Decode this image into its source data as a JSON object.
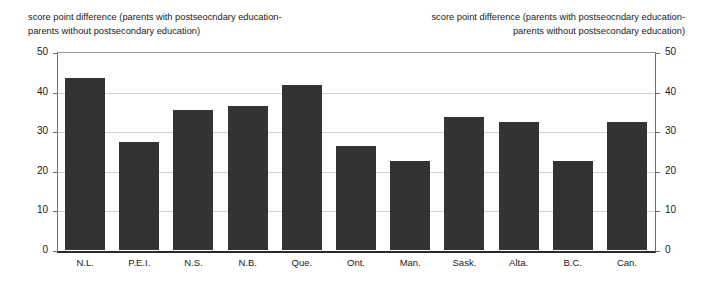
{
  "chart_data": {
    "type": "bar",
    "title": "",
    "subtitle": "",
    "ylabel": "score point difference (parents with postseocndary education-parents without postsecondary education)",
    "ylabel_right": "score point difference (parents with postseocndary education-parents without postsecondary education)",
    "xlabel": "",
    "ylim": [
      0,
      50
    ],
    "yticks": [
      0,
      10,
      20,
      30,
      40,
      50
    ],
    "grid": true,
    "legend": "none",
    "bar_color": "#333333",
    "categories": [
      "N.L.",
      "P.E.I.",
      "N.S.",
      "N.B.",
      "Que.",
      "Ont.",
      "Man.",
      "Sask.",
      "Alta.",
      "B.C.",
      "Can."
    ],
    "values": [
      43.5,
      27.3,
      35.3,
      36.4,
      41.6,
      26.3,
      22.4,
      33.5,
      32.4,
      22.5,
      32.4
    ]
  },
  "axis_titles": {
    "left_line1": "score point difference (parents with postseocndary education-",
    "left_line2": "parents without postsecondary education)",
    "right_line1": "score point difference (parents with postseocndary education-",
    "right_line2": "parents without postsecondary education)"
  },
  "yticks_display": {
    "left": [
      "50",
      "40",
      "30",
      "20",
      "10",
      "0"
    ],
    "right": [
      "50",
      "40",
      "30",
      "20",
      "10",
      "0"
    ]
  }
}
